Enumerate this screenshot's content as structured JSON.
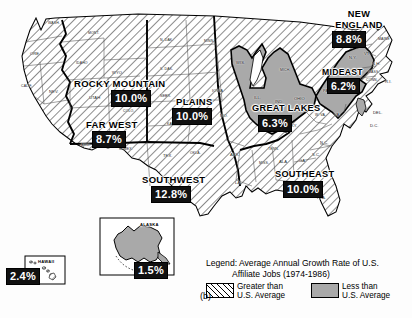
{
  "figure": {
    "label": "(b)",
    "colors": {
      "hatch_stroke": "#000000",
      "below_average_fill": "#a9a9a9",
      "region_border": "#000000",
      "state_border": "#3a3a3a",
      "chip_background": "#111111",
      "chip_text": "#ffffff",
      "page_background": "#fdfdfd"
    }
  },
  "legend": {
    "title_line1": "Legend: Average Annual Growth Rate of U.S.",
    "title_line2": "Affiliate Jobs (1974-1986)",
    "items": [
      {
        "swatch": "hatched",
        "line1": "Greater than",
        "line2": "U.S. Average"
      },
      {
        "swatch": "solid-gray",
        "line1": "Less than",
        "line2": "U.S. Average"
      }
    ]
  },
  "regions": [
    {
      "id": "far-west",
      "name": "FAR WEST",
      "value": "8.7%",
      "fill": "hatched",
      "name_x": 86,
      "name_y": 120,
      "name_size": 9.5,
      "chip_x": 92,
      "chip_y": 131,
      "chip_size": 11
    },
    {
      "id": "rocky-mountain",
      "name": "ROCKY MOUNTAIN",
      "value": "10.0%",
      "fill": "hatched",
      "name_x": 74,
      "name_y": 79,
      "name_size": 9.5,
      "chip_x": 111,
      "chip_y": 90,
      "chip_size": 11
    },
    {
      "id": "southwest",
      "name": "SOUTHWEST",
      "value": "12.8%",
      "fill": "hatched",
      "name_x": 142,
      "name_y": 175,
      "name_size": 9.5,
      "chip_x": 151,
      "chip_y": 186,
      "chip_size": 11
    },
    {
      "id": "plains",
      "name": "PLAINS",
      "value": "10.0%",
      "fill": "hatched",
      "name_x": 176,
      "name_y": 97,
      "name_size": 9.5,
      "chip_x": 172,
      "chip_y": 108,
      "chip_size": 11
    },
    {
      "id": "great-lakes",
      "name": "GREAT LAKES",
      "value": "6.3%",
      "fill": "solid-gray",
      "name_x": 252,
      "name_y": 104,
      "name_size": 9.2,
      "chip_x": 258,
      "chip_y": 115,
      "chip_size": 11
    },
    {
      "id": "southeast",
      "name": "SOUTHEAST",
      "value": "10.0%",
      "fill": "hatched",
      "name_x": 275,
      "name_y": 170,
      "name_size": 9.2,
      "chip_x": 283,
      "chip_y": 181,
      "chip_size": 11
    },
    {
      "id": "mideast",
      "name": "MIDEAST",
      "value": "6.2%",
      "fill": "solid-gray",
      "name_x": 322,
      "name_y": 68,
      "name_size": 8.6,
      "chip_x": 327,
      "chip_y": 78,
      "chip_size": 10.5
    },
    {
      "id": "new-england",
      "name": "NEW ENGLAND",
      "value": "8.8%",
      "fill": "hatched",
      "name_x": 332,
      "name_y": 9,
      "name_size": 9.2,
      "chip_x": 332,
      "chip_y": 31,
      "chip_size": 11
    },
    {
      "id": "alaska",
      "name": "ALASKA",
      "value": "1.5%",
      "fill": "solid-gray",
      "name_x": 140,
      "name_y": 223,
      "name_size": 4.1,
      "chip_x": 134,
      "chip_y": 262,
      "chip_size": 11
    },
    {
      "id": "hawaii",
      "name": "HAWAII",
      "value": "2.4%",
      "fill": "hatched",
      "name_x": 38,
      "name_y": 260,
      "name_size": 4.1,
      "chip_x": 6,
      "chip_y": 268,
      "chip_size": 11
    }
  ],
  "new_england_name_lines": [
    "NEW",
    "ENGLAND"
  ],
  "states": [
    {
      "abbr": "WASH.",
      "x": 48,
      "y": 22
    },
    {
      "abbr": "ORE.",
      "x": 30,
      "y": 52
    },
    {
      "abbr": "CALIF.",
      "x": 21,
      "y": 85
    },
    {
      "abbr": "NEV.",
      "x": 49,
      "y": 90
    },
    {
      "abbr": "IDAHO",
      "x": 76,
      "y": 62
    },
    {
      "abbr": "MONT.",
      "x": 88,
      "y": 32
    },
    {
      "abbr": "WYO.",
      "x": 112,
      "y": 71
    },
    {
      "abbr": "UTAH",
      "x": 89,
      "y": 96
    },
    {
      "abbr": "COLO.",
      "x": 123,
      "y": 110
    },
    {
      "abbr": "ARIZ.",
      "x": 81,
      "y": 144
    },
    {
      "abbr": "N. MEX.",
      "x": 119,
      "y": 148
    },
    {
      "abbr": "N. DAK.",
      "x": 160,
      "y": 39
    },
    {
      "abbr": "S. DAK.",
      "x": 160,
      "y": 68
    },
    {
      "abbr": "NEBR.",
      "x": 160,
      "y": 95
    },
    {
      "abbr": "KANS.",
      "x": 167,
      "y": 123
    },
    {
      "abbr": "OKLA.",
      "x": 190,
      "y": 152
    },
    {
      "abbr": "TEX.",
      "x": 163,
      "y": 154
    },
    {
      "abbr": "MINN.",
      "x": 204,
      "y": 40
    },
    {
      "abbr": "IOWA",
      "x": 212,
      "y": 89
    },
    {
      "abbr": "MO.",
      "x": 220,
      "y": 114
    },
    {
      "abbr": "ARK.",
      "x": 230,
      "y": 153
    },
    {
      "abbr": "LA.",
      "x": 235,
      "y": 181
    },
    {
      "abbr": "MISS.",
      "x": 259,
      "y": 162
    },
    {
      "abbr": "ALA.",
      "x": 279,
      "y": 160
    },
    {
      "abbr": "TENN.",
      "x": 268,
      "y": 148
    },
    {
      "abbr": "GA.",
      "x": 299,
      "y": 159
    },
    {
      "abbr": "FLA.",
      "x": 317,
      "y": 196
    },
    {
      "abbr": "S.C.",
      "x": 312,
      "y": 153
    },
    {
      "abbr": "N.C.",
      "x": 320,
      "y": 141
    },
    {
      "abbr": "KY.",
      "x": 291,
      "y": 124
    },
    {
      "abbr": "W. VA.",
      "x": 315,
      "y": 114
    },
    {
      "abbr": "VA.",
      "x": 334,
      "y": 113
    },
    {
      "abbr": "WIS.",
      "x": 236,
      "y": 61
    },
    {
      "abbr": "ILL.",
      "x": 254,
      "y": 96
    },
    {
      "abbr": "IND.",
      "x": 275,
      "y": 100
    },
    {
      "abbr": "OHIO",
      "x": 294,
      "y": 97
    },
    {
      "abbr": "MICH.",
      "x": 280,
      "y": 69
    },
    {
      "abbr": "PA.",
      "x": 323,
      "y": 89
    },
    {
      "abbr": "N.Y.",
      "x": 349,
      "y": 56
    },
    {
      "abbr": "VT",
      "x": 364,
      "y": 52
    },
    {
      "abbr": "N.H.",
      "x": 372,
      "y": 62
    },
    {
      "abbr": "MAINE",
      "x": 378,
      "y": 38
    },
    {
      "abbr": "MASS.",
      "x": 368,
      "y": 71
    },
    {
      "abbr": "CONN.",
      "x": 366,
      "y": 79
    },
    {
      "abbr": "R.I.",
      "x": 385,
      "y": 80
    },
    {
      "abbr": "DEL.",
      "x": 373,
      "y": 111
    },
    {
      "abbr": "D.C.",
      "x": 370,
      "y": 124
    }
  ]
}
